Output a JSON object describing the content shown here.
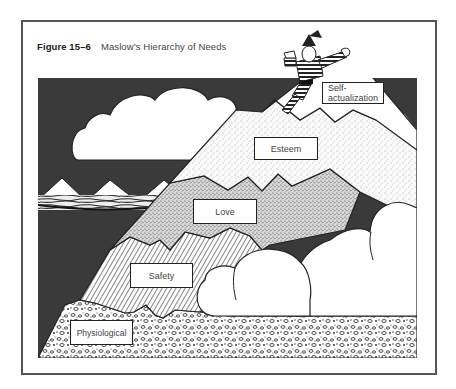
{
  "figure": {
    "number": "Figure 15–6",
    "title": "Maslow’s Hierarchy of Needs"
  },
  "levels": [
    {
      "name": "Self-actualization",
      "line1": "Self-",
      "line2": "actualization",
      "pattern": "white peak"
    },
    {
      "name": "Esteem",
      "label": "Esteem",
      "pattern": "light stipple"
    },
    {
      "name": "Love",
      "label": "Love",
      "pattern": "dense stipple"
    },
    {
      "name": "Safety",
      "label": "Safety",
      "pattern": "diagonal hatching"
    },
    {
      "name": "Physiological",
      "label": "Physiological",
      "pattern": "pebbles"
    }
  ],
  "colors": {
    "sky": "#3a3a3a",
    "frame": "#555555",
    "ink": "#222222",
    "cloud": "#ffffff"
  }
}
